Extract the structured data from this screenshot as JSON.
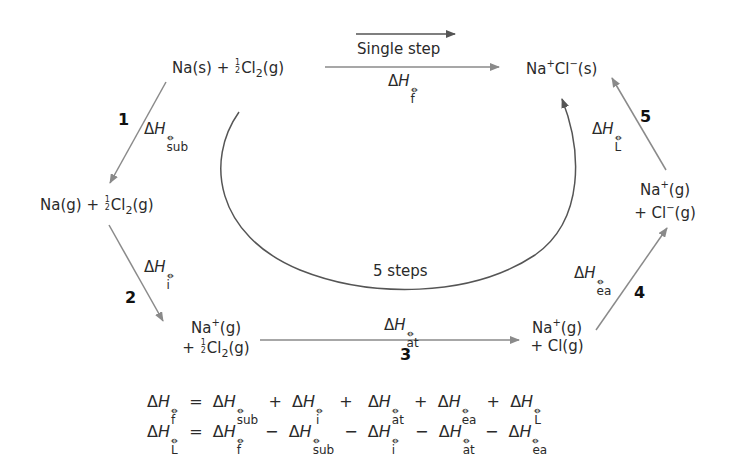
{
  "species": {
    "start": {
      "text_pre": "Na(s) + ",
      "frac": [
        "1",
        "2"
      ],
      "text_post": "Cl",
      "sub": "2",
      "tail": "(g)"
    },
    "product": {
      "a": "Na",
      "a_sup": "+",
      "b": "Cl",
      "b_sup": "−",
      "tail": "(s)"
    },
    "na_g": {
      "text_pre": "Na(g) + ",
      "frac": [
        "1",
        "2"
      ],
      "text_post": "Cl",
      "sub": "2",
      "tail": "(g)"
    },
    "na_plus_half_cl2": {
      "line1_a": "Na",
      "line1_sup": "+",
      "line1_b": "(g)",
      "line2_pre": "+ ",
      "frac": [
        "1",
        "2"
      ],
      "line2_post": "Cl",
      "sub": "2",
      "tail": "(g)"
    },
    "na_plus_cl": {
      "line1_a": "Na",
      "line1_sup": "+",
      "line1_b": "(g)",
      "line2": "+ Cl(g)"
    },
    "na_plus_cl_minus": {
      "line1_a": "Na",
      "line1_sup": "+",
      "line1_b": "(g)",
      "line2_a": "+ Cl",
      "line2_sup": "−",
      "line2_b": "(g)"
    }
  },
  "labels": {
    "single_step": "Single step",
    "five_steps": "5 steps",
    "delta": "Δ",
    "H": "H",
    "std": "⦵"
  },
  "steps": [
    {
      "number": "1",
      "subscript": "sub",
      "name": "sublimation"
    },
    {
      "number": "2",
      "subscript": "i",
      "name": "ionisation"
    },
    {
      "number": "3",
      "subscript": "at",
      "name": "atomisation"
    },
    {
      "number": "4",
      "subscript": "ea",
      "name": "electron affinity"
    },
    {
      "number": "5",
      "subscript": "L",
      "name": "lattice"
    }
  ],
  "formation_subscript": "f",
  "equations": [
    {
      "lhs": "f",
      "op": "=",
      "terms": [
        {
          "s": "sub",
          "op": "+"
        },
        {
          "s": "i",
          "op": "+"
        },
        {
          "s": "at",
          "op": "+"
        },
        {
          "s": "ea",
          "op": "+"
        },
        {
          "s": "L",
          "op": ""
        }
      ]
    },
    {
      "lhs": "L",
      "op": "=",
      "terms": [
        {
          "s": "f",
          "op": "−"
        },
        {
          "s": "sub",
          "op": "−"
        },
        {
          "s": "i",
          "op": "−"
        },
        {
          "s": "at",
          "op": "−"
        },
        {
          "s": "ea",
          "op": ""
        }
      ]
    }
  ],
  "colors": {
    "arrow": "#8a8a8a",
    "arc": "#555555",
    "text": "#2a2a2a"
  }
}
